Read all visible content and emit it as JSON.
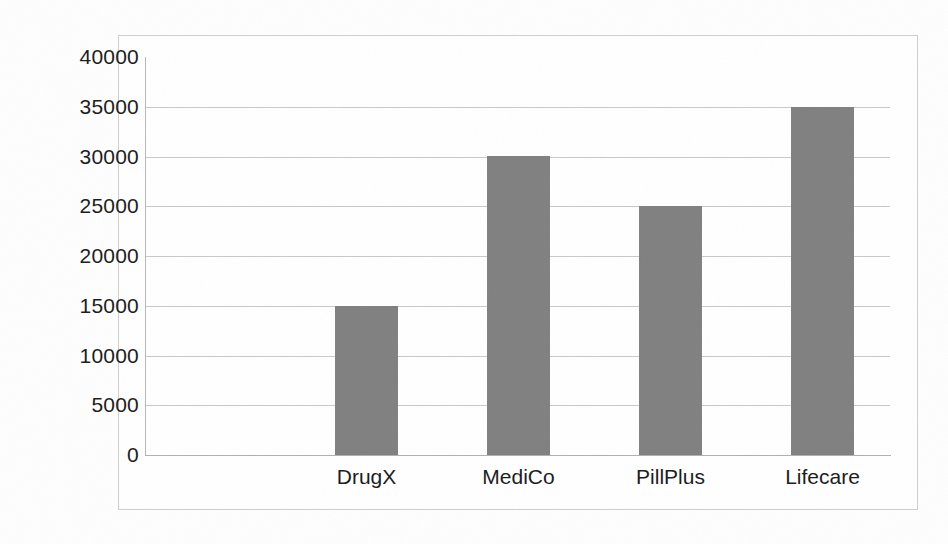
{
  "chart_data": {
    "type": "bar",
    "title": "",
    "subtitle": "",
    "xlabel": "",
    "ylabel": "",
    "categories": [
      "DrugX",
      "MediCo",
      "PillPlus",
      "Lifecare"
    ],
    "values": [
      15000,
      30000,
      25000,
      35000
    ],
    "series": [
      {
        "name": "",
        "values": [
          15000,
          30000,
          25000,
          35000
        ]
      }
    ],
    "ylim": [
      0,
      40000
    ],
    "y_tick_step": 5000,
    "y_ticks": [
      40000,
      35000,
      30000,
      25000,
      20000,
      15000,
      10000,
      5000,
      0
    ],
    "y_tick_labels": [
      "40000",
      "35000",
      "30000",
      "25000",
      "20000",
      "15000",
      "10000",
      "5000",
      "0"
    ],
    "grid": true,
    "grid_axis": "y",
    "legend": false,
    "legend_position": "none",
    "annotations": [],
    "colors": {
      "bar_fill": "#808080",
      "gridline": "#c9c9c9",
      "axis_line": "#b0b0b0",
      "frame_border": "#cfcfcf",
      "text": "#1b1b1b",
      "background": "#ffffff"
    }
  },
  "figure": {
    "frame_visible": true,
    "background": "#ffffff"
  }
}
